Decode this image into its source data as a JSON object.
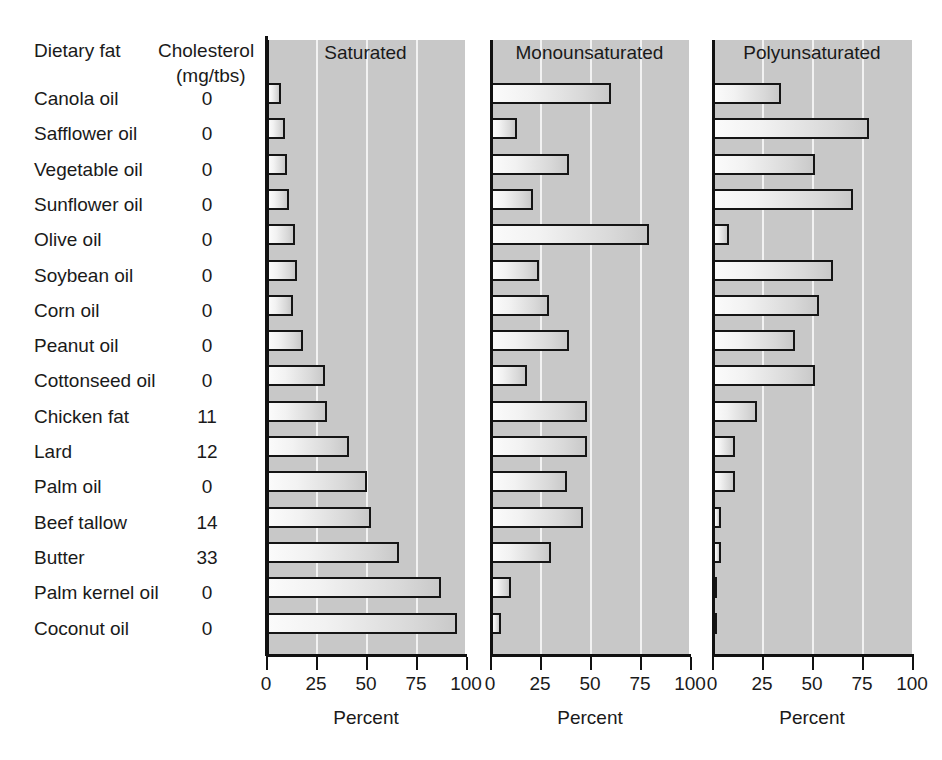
{
  "table": {
    "header_fat": "Dietary fat",
    "header_cholesterol": "Cholesterol",
    "header_unit": "(mg/tbs)"
  },
  "axis": {
    "title": "Percent",
    "ticks": [
      "0",
      "25",
      "50",
      "75",
      "100"
    ],
    "tick_values": [
      0,
      25,
      50,
      75,
      100
    ],
    "min": 0,
    "max": 100
  },
  "panels": [
    {
      "title": "Saturated"
    },
    {
      "title": "Monounsaturated"
    },
    {
      "title": "Polyunsaturated"
    }
  ],
  "colors": {
    "panel_background": "#c8c8c8",
    "gridline": "#f2f2f2",
    "bar_border": "#151515",
    "bar_fill_light": "#fbfbfb",
    "bar_fill_dark": "#c9c9c9",
    "text": "#1a1a1a"
  },
  "chart_data": {
    "type": "bar",
    "title": "",
    "orientation": "horizontal",
    "xlabel": "Percent",
    "ylabel": "Dietary fat",
    "xlim": [
      0,
      100
    ],
    "grid": true,
    "legend": "none",
    "categories": [
      "Canola oil",
      "Safflower oil",
      "Vegetable oil",
      "Sunflower oil",
      "Olive oil",
      "Soybean oil",
      "Corn oil",
      "Peanut oil",
      "Cottonseed oil",
      "Chicken fat",
      "Lard",
      "Palm oil",
      "Beef tallow",
      "Butter",
      "Palm kernel oil",
      "Coconut oil"
    ],
    "cholesterol_mg_per_tbs": [
      0,
      0,
      0,
      0,
      0,
      0,
      0,
      0,
      0,
      11,
      12,
      0,
      14,
      33,
      0,
      0
    ],
    "series": [
      {
        "name": "Saturated",
        "values": [
          7,
          9,
          10,
          11,
          14,
          15,
          13,
          18,
          29,
          30,
          41,
          50,
          52,
          66,
          87,
          95
        ]
      },
      {
        "name": "Monounsaturated",
        "values": [
          60,
          13,
          39,
          21,
          79,
          24,
          29,
          39,
          18,
          48,
          48,
          38,
          46,
          30,
          10,
          5
        ]
      },
      {
        "name": "Polyunsaturated",
        "values": [
          34,
          78,
          51,
          70,
          8,
          60,
          53,
          41,
          51,
          22,
          11,
          11,
          4,
          4,
          2,
          1
        ]
      }
    ]
  }
}
